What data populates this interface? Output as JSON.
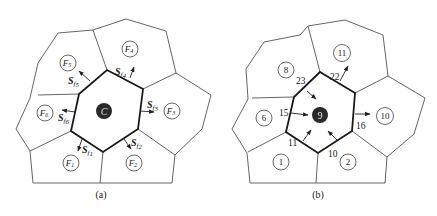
{
  "panel_a": {
    "caption": "(a)",
    "center_label": "C",
    "neighbors": [
      {
        "id": "F1",
        "label": "F",
        "sub": "1",
        "x": 71,
        "y": 163
      },
      {
        "id": "F2",
        "label": "F",
        "sub": "2",
        "x": 134,
        "y": 163
      },
      {
        "id": "F3",
        "label": "F",
        "sub": "3",
        "x": 171,
        "y": 111
      },
      {
        "id": "F4",
        "label": "F",
        "sub": "4",
        "x": 130,
        "y": 49
      },
      {
        "id": "F5",
        "label": "F",
        "sub": "5",
        "x": 67,
        "y": 62
      },
      {
        "id": "F6",
        "label": "F",
        "sub": "6",
        "x": 45,
        "y": 113
      }
    ],
    "face_vectors": [
      {
        "label": "S",
        "sub": "f1",
        "sub_idx": "1"
      },
      {
        "label": "S",
        "sub": "f2",
        "sub_idx": "2"
      },
      {
        "label": "S",
        "sub": "f3",
        "sub_idx": "3"
      },
      {
        "label": "S",
        "sub": "f4",
        "sub_idx": "4"
      },
      {
        "label": "S",
        "sub": "f5",
        "sub_idx": "5"
      },
      {
        "label": "S",
        "sub": "f6",
        "sub_idx": "6"
      }
    ]
  },
  "panel_b": {
    "caption": "(b)",
    "center_label": "9",
    "neighbors": [
      {
        "label": "1",
        "x": 281,
        "y": 163
      },
      {
        "label": "2",
        "x": 348,
        "y": 163
      },
      {
        "label": "10",
        "x": 385,
        "y": 116
      },
      {
        "label": "11",
        "x": 341,
        "y": 53
      },
      {
        "label": "8",
        "x": 286,
        "y": 70
      },
      {
        "label": "6",
        "x": 263,
        "y": 118
      }
    ],
    "face_numbers": [
      {
        "label": "11",
        "x": 290,
        "y": 142
      },
      {
        "label": "10",
        "x": 324,
        "y": 155
      },
      {
        "label": "16",
        "x": 356,
        "y": 128
      },
      {
        "label": "22",
        "x": 324,
        "y": 77
      },
      {
        "label": "23",
        "x": 295,
        "y": 82
      },
      {
        "label": "15",
        "x": 280,
        "y": 117
      }
    ]
  }
}
